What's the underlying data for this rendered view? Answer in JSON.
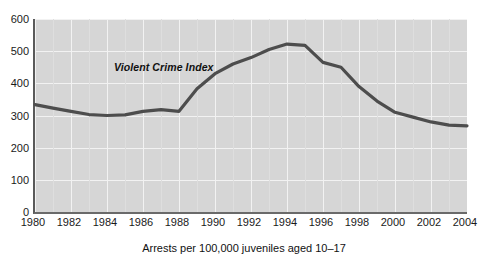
{
  "chart_data": {
    "type": "line",
    "title": "",
    "subtitle": "",
    "xlabel": "Arrests per 100,000 juveniles aged 10–17",
    "ylabel": "",
    "xlim": [
      1980,
      2004
    ],
    "ylim": [
      0,
      600
    ],
    "grid": true,
    "legend_position": "inline-annotation",
    "annotations": [
      {
        "text": "Violent Crime Index",
        "x": 1989,
        "y": 432
      }
    ],
    "y_ticks": [
      0,
      100,
      200,
      300,
      400,
      500,
      600
    ],
    "x_ticks": [
      1980,
      1982,
      1984,
      1986,
      1988,
      1990,
      1992,
      1994,
      1996,
      1998,
      2000,
      2002,
      2004
    ],
    "x_ticks_labels": [
      "1980",
      "1982",
      "1984",
      "1986",
      "1988",
      "1990",
      "1992",
      "1994",
      "1996",
      "1998",
      "2000",
      "2002",
      "2004"
    ],
    "y_ticks_labels": [
      "0",
      "100",
      "200",
      "300",
      "400",
      "500",
      "600"
    ],
    "series": [
      {
        "name": "Violent Crime Index",
        "color": "#4d4d4d",
        "x": [
          1980,
          1981,
          1982,
          1983,
          1984,
          1985,
          1986,
          1987,
          1988,
          1989,
          1990,
          1991,
          1992,
          1993,
          1994,
          1995,
          1996,
          1997,
          1998,
          1999,
          2000,
          2001,
          2002,
          2003,
          2004
        ],
        "values": [
          334,
          323,
          313,
          303,
          300,
          302,
          313,
          318,
          313,
          383,
          430,
          460,
          480,
          505,
          522,
          518,
          465,
          450,
          390,
          345,
          310,
          295,
          280,
          270,
          268
        ]
      }
    ]
  },
  "axes": {
    "y_axis_name": "y-axis",
    "x_axis_name": "x-axis"
  },
  "colors": {
    "plot_background": "#d6d6d6",
    "gridline": "#f2f2f2",
    "series_line": "#4d4d4d",
    "axis_line": "#5a5a5a",
    "text": "#111111",
    "page_background": "#ffffff"
  }
}
